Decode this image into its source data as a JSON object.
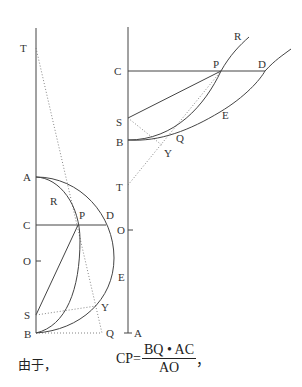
{
  "left_figure": {
    "labels": {
      "T": "T",
      "A": "A",
      "R": "R",
      "C": "C",
      "P": "P",
      "D": "D",
      "O": "O",
      "E": "E",
      "S": "S",
      "Y": "Y",
      "B": "B",
      "Q": "Q"
    }
  },
  "right_figure": {
    "labels": {
      "R": "R",
      "C": "C",
      "P": "P",
      "D": "D",
      "S": "S",
      "Q": "Q",
      "E": "E",
      "B": "B",
      "Y": "Y",
      "T": "T",
      "O": "O",
      "A": "A"
    }
  },
  "caption": {
    "text": "由于，",
    "formula_lhs": "CP=",
    "numerator": "BQ • AC",
    "denominator": "AO",
    "trailing": "，"
  }
}
